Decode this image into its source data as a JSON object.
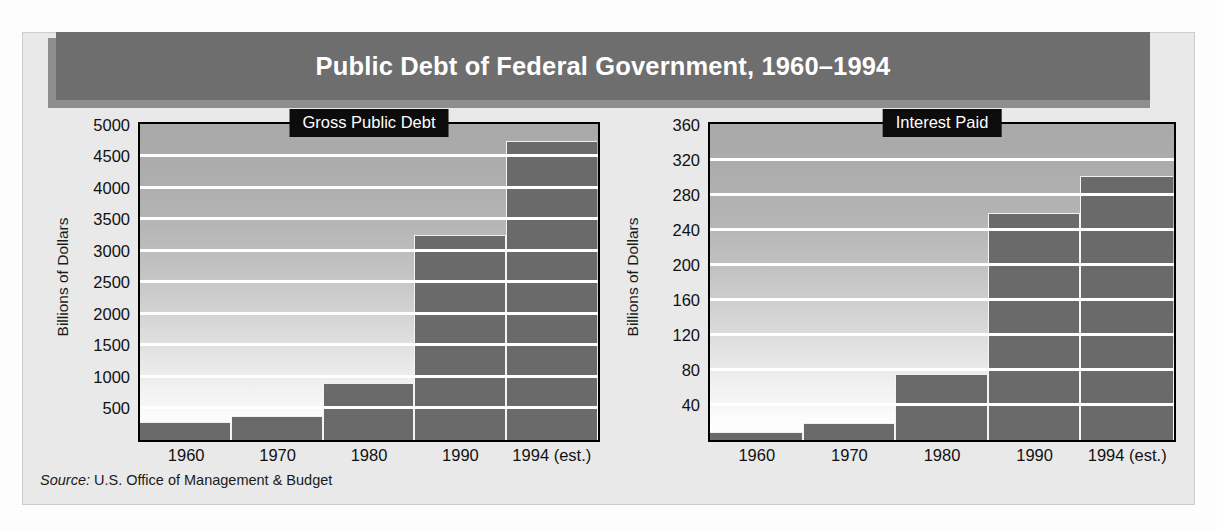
{
  "banner": {
    "title": "Public Debt of Federal Government, 1960–1994",
    "background_color": "#6e6e6e",
    "shadow_color": "#8e8e8e",
    "text_color": "#ffffff"
  },
  "source": {
    "label": "Source:",
    "text": "U.S. Office of Management & Budget"
  },
  "panel": {
    "background_color": "#e9e9e9"
  },
  "style": {
    "bar_color": "#6a6a6a",
    "gridline_color": "#ffffff",
    "plot_border_color": "#000000",
    "label_box_color": "#0c0c0c",
    "label_text_color": "#ffffff"
  },
  "chart_data": [
    {
      "type": "bar",
      "title": "Gross Public Debt",
      "xlabel": "",
      "ylabel": "Billions of Dollars",
      "categories": [
        "1960",
        "1970",
        "1980",
        "1990",
        "1994 (est.)"
      ],
      "values": [
        290,
        380,
        910,
        3250,
        4750
      ],
      "ylim": [
        0,
        5000
      ],
      "yticks": [
        500,
        1000,
        1500,
        2000,
        2500,
        3000,
        3500,
        4000,
        4500,
        5000
      ],
      "ytick_labels": [
        "500",
        "1000",
        "1500",
        "2000",
        "2500",
        "3000",
        "3500",
        "4000",
        "4500",
        "5000"
      ],
      "grid": true,
      "legend": "none"
    },
    {
      "type": "bar",
      "title": "Interest Paid",
      "xlabel": "",
      "ylabel": "Billions of Dollars",
      "categories": [
        "1960",
        "1970",
        "1980",
        "1990",
        "1994 (est.)"
      ],
      "values": [
        9,
        19,
        75,
        260,
        302
      ],
      "ylim": [
        0,
        360
      ],
      "yticks": [
        40,
        80,
        120,
        160,
        200,
        240,
        280,
        320,
        360
      ],
      "ytick_labels": [
        "40",
        "80",
        "120",
        "160",
        "200",
        "240",
        "280",
        "320",
        "360"
      ],
      "grid": true,
      "legend": "none"
    }
  ]
}
